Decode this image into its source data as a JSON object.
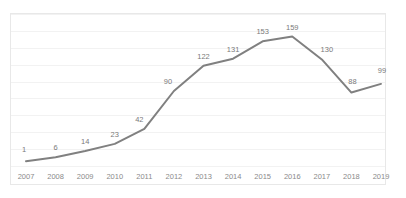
{
  "chart_data": {
    "type": "line",
    "title": "",
    "subtitle": "",
    "xlabel": "",
    "ylabel": "",
    "categories": [
      "2007",
      "2008",
      "2009",
      "2010",
      "2011",
      "2012",
      "2013",
      "2014",
      "2015",
      "2016",
      "2017",
      "2018",
      "2019"
    ],
    "values": [
      1,
      6,
      14,
      23,
      42,
      90,
      122,
      131,
      153,
      159,
      130,
      88,
      99
    ],
    "data_labels": [
      "1",
      "6",
      "14",
      "23",
      "42",
      "90",
      "122",
      "131",
      "153",
      "159",
      "130",
      "88",
      "99"
    ],
    "tick_labels": [
      "2007",
      "2008",
      "2009",
      "2010",
      "2011",
      "2012",
      "2013",
      "2014",
      "2015",
      "2016",
      "2017",
      "2018",
      "2019"
    ],
    "ylim": [
      0,
      180
    ],
    "xlim_categories": 13,
    "grid": true,
    "gridlines_count": 9,
    "legend": false,
    "legend_position": "none",
    "y_axis_labels_shown": false,
    "series": [
      {
        "name": "series-1",
        "values": [
          1,
          6,
          14,
          23,
          42,
          90,
          122,
          131,
          153,
          159,
          130,
          88,
          99
        ]
      }
    ],
    "colors": {
      "line": "#808080",
      "gridline": "#f2f2f2",
      "border": "#e8e8e8",
      "label_text": "#7a7a7a",
      "tick_text": "#8a8a8a",
      "background": "#ffffff"
    }
  }
}
